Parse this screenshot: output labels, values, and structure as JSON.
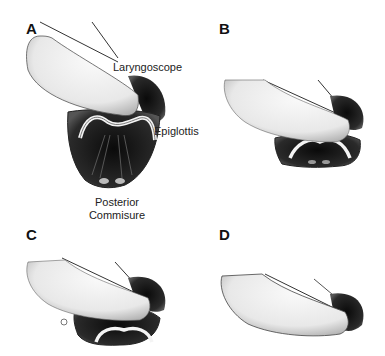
{
  "figure": {
    "panels": [
      {
        "letter": "A",
        "description": "Full view of glottis with vocal cords"
      },
      {
        "letter": "B",
        "description": "Posterior portion of glottis visible"
      },
      {
        "letter": "C",
        "description": "Only epiglottis visible"
      },
      {
        "letter": "D",
        "description": "Epiglottis not visible"
      }
    ],
    "labels": {
      "laryngoscope": "Laryngoscope",
      "epiglottis": "Epiglottis",
      "posterior_line1": "Posterior",
      "posterior_line2": "Commisure"
    },
    "colors": {
      "background": "#ffffff",
      "ink": "#111111",
      "tissue_dark": "#1a1a1a",
      "blade_light": "#f2f2f2"
    }
  }
}
